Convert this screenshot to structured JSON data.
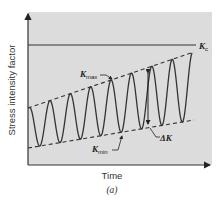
{
  "figure": {
    "caption": "(a)",
    "axes": {
      "xlabel": "Time",
      "ylabel": "Stress intensity factor"
    },
    "annotations": {
      "kc": {
        "main": "K",
        "sub": "c"
      },
      "kmax": {
        "main": "K",
        "sub": "max"
      },
      "kmin": {
        "main": "K",
        "sub": "min"
      },
      "delta_k": "ΔK"
    },
    "colors": {
      "plot_background": "#dcdcdc",
      "line": "#333333"
    }
  },
  "chart_data": {
    "type": "line",
    "title": "",
    "xlabel": "Time",
    "ylabel": "Stress intensity factor",
    "grid": false,
    "series": [
      {
        "name": "K_c",
        "style": "solid horizontal",
        "values": [
          1.0,
          1.0
        ]
      },
      {
        "name": "K_max",
        "style": "dashed",
        "x": [
          0,
          1
        ],
        "values": [
          0.53,
          0.95
        ]
      },
      {
        "name": "K_min",
        "style": "dashed",
        "x": [
          0,
          1
        ],
        "values": [
          0.13,
          0.35
        ]
      },
      {
        "name": "K(t)",
        "style": "solid sinusoid",
        "cycles": 8
      }
    ]
  }
}
